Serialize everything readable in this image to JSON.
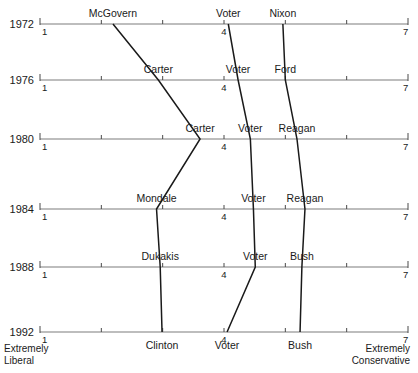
{
  "chart_data": {
    "type": "line",
    "title": "",
    "xlabel": "",
    "ylabel": "",
    "xlim": [
      1,
      7
    ],
    "grid": false,
    "legend_position": "none",
    "orientation": "horizontal-axes-stacked-by-year",
    "axis_ticks": [
      1,
      2,
      3,
      4,
      5,
      6,
      7
    ],
    "axis_tick_labels_shown": [
      "1",
      "4",
      "7"
    ],
    "scale_anchor_left": "Extremely Liberal",
    "scale_anchor_right": "Extremely Conservative",
    "rows": [
      {
        "year": "1972",
        "left_num": "1",
        "mid_num": "4",
        "right_num": "7"
      },
      {
        "year": "1976",
        "left_num": "1",
        "mid_num": "4",
        "right_num": "7"
      },
      {
        "year": "1980",
        "left_num": "1",
        "mid_num": "4",
        "right_num": "7"
      },
      {
        "year": "1984",
        "left_num": "1",
        "mid_num": "4",
        "right_num": "7"
      },
      {
        "year": "1988",
        "left_num": "1",
        "mid_num": "4",
        "right_num": "7"
      },
      {
        "year": "1992",
        "left_num": "1",
        "mid_num": "4",
        "right_num": "7"
      }
    ],
    "series": [
      {
        "name": "Democratic nominee",
        "points": [
          {
            "year": "1972",
            "label": "McGovern",
            "value": 2.19
          },
          {
            "year": "1976",
            "label": "Carter",
            "value": 2.93
          },
          {
            "year": "1980",
            "label": "Carter",
            "value": 3.61
          },
          {
            "year": "1984",
            "label": "Mondale",
            "value": 2.9
          },
          {
            "year": "1988",
            "label": "Dukakis",
            "value": 2.96
          },
          {
            "year": "1992",
            "label": "Clinton",
            "value": 2.99
          }
        ]
      },
      {
        "name": "Voter",
        "points": [
          {
            "year": "1972",
            "label": "Voter",
            "value": 4.07
          },
          {
            "year": "1976",
            "label": "Voter",
            "value": 4.23
          },
          {
            "year": "1980",
            "label": "Voter",
            "value": 4.43
          },
          {
            "year": "1984",
            "label": "Voter",
            "value": 4.48
          },
          {
            "year": "1988",
            "label": "Voter",
            "value": 4.51
          },
          {
            "year": "1992",
            "label": "Voter",
            "value": 4.05
          }
        ]
      },
      {
        "name": "Republican nominee",
        "points": [
          {
            "year": "1972",
            "label": "Nixon",
            "value": 4.96
          },
          {
            "year": "1976",
            "label": "Ford",
            "value": 5.0
          },
          {
            "year": "1980",
            "label": "Reagan",
            "value": 5.19
          },
          {
            "year": "1984",
            "label": "Reagan",
            "value": 5.32
          },
          {
            "year": "1988",
            "label": "Bush",
            "value": 5.27
          },
          {
            "year": "1992",
            "label": "Bush",
            "value": 5.24
          }
        ]
      }
    ]
  }
}
